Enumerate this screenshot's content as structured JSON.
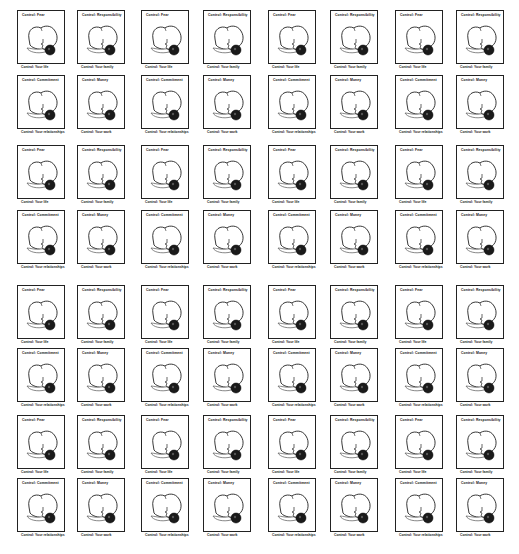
{
  "labels": {
    "fear": "Control: Fear",
    "responsibility": "Control: Responsibility",
    "commitment": "Control: Commitment",
    "money": "Control: Money",
    "life": "Control: Your life",
    "family": "Control: Your family",
    "relationships": "Control: Your relationships",
    "work": "Control: Your work"
  },
  "quad_pattern": [
    {
      "top": "Control: Fear",
      "bottom": "Control: Your life"
    },
    {
      "top": "Control: Responsibility",
      "bottom": "Control: Your family"
    },
    {
      "top": "Control: Commitment",
      "bottom": "Control: Your relationships"
    },
    {
      "top": "Control: Money",
      "bottom": "Control: Your work"
    }
  ],
  "grid": {
    "columns": 8,
    "rows": 8,
    "col_x": [
      17,
      77,
      141,
      203,
      268,
      330,
      395,
      456
    ],
    "row_y": [
      10,
      75,
      145,
      210,
      285,
      348,
      415,
      478
    ]
  },
  "colors": {
    "stroke": "#222222",
    "fill_dark": "#1a1a1a",
    "background": "#ffffff"
  },
  "caption": ""
}
